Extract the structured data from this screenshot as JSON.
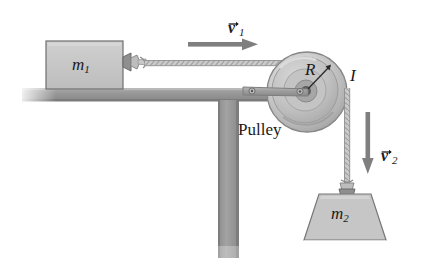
{
  "figure": {
    "background_color": "#ffffff"
  },
  "labels": {
    "mass1": "m",
    "mass1_sub": "1",
    "mass2": "m",
    "mass2_sub": "2",
    "radius": "R",
    "inertia": "I",
    "pulley": "Pulley",
    "velocity1": "v",
    "velocity1_sub": "1",
    "velocity2": "v",
    "velocity2_sub": "2"
  },
  "colors": {
    "block_fill": "#c6c6c6",
    "block_stroke": "#6e6e6e",
    "table_fill": "#9a9a9a",
    "table_stroke": "#7c7c7c",
    "pulley_rim": "#a8a8a8",
    "pulley_mid": "#c9c9c9",
    "pulley_inner": "#bdbdbd",
    "pulley_hub": "#6a6a6a",
    "arrow_gray": "#7f7f7f",
    "rope_gray": "#b5b5b5",
    "bracket_gray": "#a0a0a0",
    "text": "#1a1a1a"
  },
  "geometry": {
    "pulley_center_x": 307,
    "pulley_center_y": 92,
    "pulley_radius": 40,
    "table_top_y": 88,
    "post_x": 218,
    "post_width": 20
  }
}
